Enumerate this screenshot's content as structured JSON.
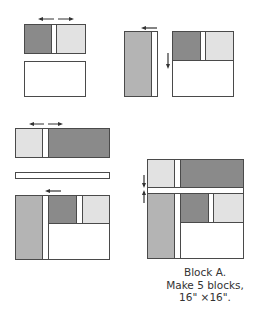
{
  "caption": {
    "line1": "Block A.",
    "line2": "Make 5 blocks,",
    "line3": "16\" ×16\"."
  },
  "colors": {
    "dark": "#8a8a8a",
    "medium": "#b4b4b4",
    "light": "#e2e2e2",
    "background": "#ffffff",
    "outline": "#4a4a4a"
  },
  "steps": [
    {
      "id": "step-1",
      "description": "Dark square + white strip + light square, pressed outward; white rectangle below"
    },
    {
      "id": "step-2",
      "description": "Medium tall rectangle + white strip, pressed left; joined to unit with white bottom, pressed down"
    },
    {
      "id": "step-3",
      "description": "Light square + white strip + dark long rectangle, pressed outward; long white strip; medium tall unit with squares"
    },
    {
      "id": "step-4",
      "description": "Completed Block A assembled from units, pressed toward centre strip"
    }
  ]
}
